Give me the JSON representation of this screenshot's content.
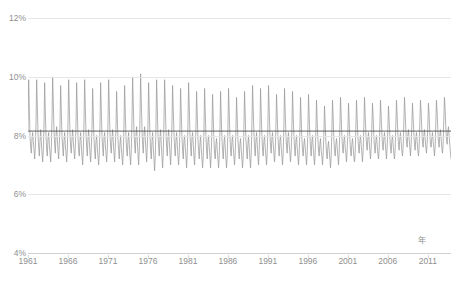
{
  "chart_data": {
    "type": "line",
    "title": "",
    "xlabel": "年",
    "ylabel": "",
    "ylim": [
      4,
      12
    ],
    "xlim": [
      1961,
      2013.9
    ],
    "grid": true,
    "legend": false,
    "y_ticks": [
      "4%",
      "6%",
      "8%",
      "10%",
      "12%"
    ],
    "y_tick_values": [
      4,
      6,
      8,
      10,
      12
    ],
    "x_ticks": [
      "1961",
      "1966",
      "1971",
      "1976",
      "1981",
      "1986",
      "1991",
      "1996",
      "2001",
      "2006",
      "2011"
    ],
    "x_tick_values": [
      1961,
      1966,
      1971,
      1976,
      1981,
      1986,
      1991,
      1996,
      2001,
      2006,
      2011
    ],
    "series": [
      {
        "name": "monthly-rate",
        "color": "#9a9a9a",
        "x_start": 1961.0,
        "x_step": 0.08333,
        "values": [
          8.2,
          9.9,
          8.9,
          8.0,
          7.6,
          7.4,
          7.9,
          8.1,
          7.8,
          7.5,
          7.2,
          7.6,
          8.4,
          9.9,
          9.0,
          8.1,
          7.6,
          7.3,
          7.8,
          8.2,
          7.8,
          7.4,
          7.1,
          7.5,
          8.3,
          9.8,
          8.8,
          8.0,
          7.5,
          7.3,
          7.9,
          8.1,
          7.7,
          7.4,
          7.1,
          7.6,
          8.5,
          10.0,
          9.1,
          8.2,
          7.7,
          7.4,
          8.0,
          8.3,
          7.9,
          7.5,
          7.2,
          7.7,
          8.3,
          9.7,
          8.8,
          8.0,
          7.6,
          7.3,
          7.8,
          8.1,
          7.7,
          7.4,
          7.1,
          7.5,
          8.4,
          9.9,
          9.0,
          8.1,
          7.6,
          7.4,
          7.9,
          8.2,
          7.8,
          7.5,
          7.2,
          7.6,
          8.3,
          9.8,
          8.9,
          8.0,
          7.5,
          7.3,
          7.8,
          8.1,
          7.7,
          7.3,
          7.0,
          7.5,
          8.4,
          9.9,
          9.0,
          8.1,
          7.6,
          7.3,
          7.9,
          8.2,
          7.8,
          7.4,
          7.1,
          7.6,
          8.2,
          9.6,
          8.7,
          7.9,
          7.5,
          7.2,
          7.8,
          8.0,
          7.6,
          7.3,
          7.0,
          7.4,
          8.3,
          9.8,
          8.9,
          8.0,
          7.6,
          7.3,
          7.9,
          8.1,
          7.7,
          7.4,
          7.1,
          7.5,
          8.4,
          9.9,
          9.0,
          8.1,
          7.6,
          7.4,
          7.9,
          8.2,
          7.8,
          7.4,
          7.1,
          7.6,
          8.2,
          9.5,
          8.6,
          7.9,
          7.5,
          7.2,
          7.7,
          8.0,
          7.6,
          7.3,
          7.0,
          7.4,
          8.3,
          9.7,
          8.8,
          8.0,
          7.5,
          7.3,
          7.8,
          8.1,
          7.7,
          7.3,
          7.0,
          7.5,
          8.4,
          10.0,
          9.1,
          8.2,
          7.7,
          7.4,
          8.0,
          8.3,
          7.8,
          7.4,
          7.0,
          7.5,
          8.5,
          10.1,
          9.2,
          8.3,
          7.7,
          7.4,
          8.0,
          8.3,
          7.9,
          7.5,
          7.1,
          7.6,
          8.3,
          9.8,
          8.9,
          8.0,
          7.5,
          7.2,
          7.8,
          8.1,
          7.6,
          7.2,
          6.8,
          7.3,
          8.2,
          9.9,
          9.0,
          8.1,
          7.6,
          7.3,
          7.9,
          8.2,
          7.7,
          7.3,
          6.9,
          7.4,
          8.4,
          9.9,
          9.1,
          8.2,
          7.6,
          7.3,
          7.9,
          8.2,
          7.8,
          7.4,
          7.0,
          7.5,
          8.3,
          9.7,
          8.9,
          8.1,
          7.6,
          7.3,
          7.8,
          8.1,
          7.7,
          7.3,
          7.0,
          7.4,
          8.2,
          9.6,
          8.8,
          8.0,
          7.5,
          7.2,
          7.8,
          8.0,
          7.6,
          7.3,
          6.9,
          7.4,
          8.3,
          9.8,
          9.0,
          8.1,
          7.6,
          7.3,
          7.9,
          8.1,
          7.7,
          7.3,
          7.0,
          7.5,
          8.2,
          9.5,
          8.7,
          7.9,
          7.5,
          7.2,
          7.7,
          8.0,
          7.6,
          7.2,
          6.9,
          7.3,
          8.1,
          9.6,
          8.8,
          8.0,
          7.5,
          7.2,
          7.8,
          8.0,
          7.6,
          7.3,
          6.9,
          7.4,
          8.2,
          9.4,
          8.6,
          7.9,
          7.4,
          7.2,
          7.7,
          7.9,
          7.5,
          7.2,
          6.9,
          7.3,
          8.1,
          9.5,
          8.7,
          7.9,
          7.5,
          7.2,
          7.7,
          8.0,
          7.6,
          7.2,
          6.9,
          7.3,
          8.2,
          9.6,
          8.8,
          8.0,
          7.5,
          7.3,
          7.8,
          8.0,
          7.6,
          7.3,
          7.0,
          7.4,
          8.1,
          9.3,
          8.6,
          7.9,
          7.5,
          7.2,
          7.7,
          7.9,
          7.5,
          7.2,
          6.9,
          7.3,
          8.2,
          9.5,
          8.7,
          7.9,
          7.5,
          7.2,
          7.7,
          8.0,
          7.6,
          7.2,
          6.9,
          7.4,
          8.3,
          9.7,
          8.9,
          8.1,
          7.6,
          7.3,
          7.8,
          8.1,
          7.7,
          7.3,
          7.0,
          7.5,
          8.2,
          9.6,
          8.8,
          8.0,
          7.5,
          7.3,
          7.8,
          8.0,
          7.6,
          7.3,
          7.0,
          7.4,
          8.3,
          9.7,
          8.9,
          8.1,
          7.6,
          7.4,
          7.9,
          8.1,
          7.7,
          7.4,
          7.1,
          7.5,
          8.2,
          9.4,
          8.7,
          8.0,
          7.6,
          7.3,
          7.8,
          8.0,
          7.6,
          7.3,
          7.0,
          7.4,
          8.3,
          9.6,
          8.8,
          8.1,
          7.6,
          7.4,
          7.9,
          8.1,
          7.7,
          7.4,
          7.1,
          7.5,
          8.2,
          9.5,
          8.7,
          8.0,
          7.6,
          7.3,
          7.8,
          8.0,
          7.6,
          7.3,
          7.0,
          7.4,
          8.1,
          9.3,
          8.6,
          7.9,
          7.5,
          7.3,
          7.7,
          7.9,
          7.6,
          7.3,
          7.0,
          7.4,
          8.2,
          9.4,
          8.7,
          8.0,
          7.6,
          7.3,
          7.8,
          8.0,
          7.6,
          7.3,
          7.0,
          7.4,
          8.1,
          9.2,
          8.5,
          7.9,
          7.5,
          7.3,
          7.7,
          7.9,
          7.5,
          7.3,
          7.0,
          7.4,
          8.0,
          9.0,
          8.4,
          7.8,
          7.4,
          7.2,
          7.6,
          7.8,
          7.5,
          7.2,
          6.9,
          7.3,
          8.1,
          9.2,
          8.6,
          7.9,
          7.5,
          7.3,
          7.7,
          7.9,
          7.6,
          7.3,
          7.0,
          7.4,
          8.2,
          9.3,
          8.7,
          8.0,
          7.6,
          7.4,
          7.8,
          8.0,
          7.6,
          7.4,
          7.1,
          7.5,
          8.1,
          9.1,
          8.5,
          7.9,
          7.5,
          7.3,
          7.7,
          7.9,
          7.6,
          7.3,
          7.1,
          7.4,
          8.2,
          9.2,
          8.6,
          8.0,
          7.6,
          7.4,
          7.8,
          8.0,
          7.7,
          7.4,
          7.1,
          7.5,
          8.3,
          9.3,
          8.7,
          8.1,
          7.7,
          7.5,
          7.9,
          8.1,
          7.8,
          7.5,
          7.2,
          7.6,
          8.2,
          9.1,
          8.6,
          8.0,
          7.6,
          7.4,
          7.8,
          8.0,
          7.7,
          7.4,
          7.2,
          7.5,
          8.3,
          9.2,
          8.7,
          8.1,
          7.7,
          7.5,
          7.9,
          8.1,
          7.8,
          7.5,
          7.2,
          7.6,
          8.2,
          9.0,
          8.5,
          8.0,
          7.6,
          7.4,
          7.8,
          8.0,
          7.7,
          7.4,
          7.2,
          7.5,
          8.3,
          9.2,
          8.7,
          8.1,
          7.7,
          7.5,
          7.9,
          8.1,
          7.8,
          7.5,
          7.3,
          7.6,
          8.4,
          9.3,
          8.8,
          8.2,
          7.8,
          7.6,
          8.0,
          8.2,
          7.9,
          7.6,
          7.3,
          7.7,
          8.3,
          9.1,
          8.6,
          8.1,
          7.7,
          7.5,
          7.9,
          8.1,
          7.8,
          7.5,
          7.3,
          7.6,
          8.4,
          9.2,
          8.8,
          8.2,
          7.8,
          7.6,
          8.0,
          8.2,
          7.9,
          7.6,
          7.4,
          7.7,
          8.3,
          9.1,
          8.7,
          8.1,
          7.7,
          7.6,
          7.9,
          8.1,
          7.8,
          7.6,
          7.3,
          7.6,
          8.4,
          9.2,
          8.8,
          8.2,
          7.8,
          7.6,
          8.0,
          8.2,
          7.9,
          7.6,
          7.4,
          7.7,
          8.5,
          9.3,
          8.9,
          8.3,
          7.9,
          7.7,
          8.1,
          8.3,
          8.0,
          7.7,
          7.4,
          7.2
        ]
      }
    ],
    "reference_line": {
      "name": "trend-line",
      "value": 8.15,
      "color": "#4d4d4d"
    }
  },
  "axis": {
    "y_title": "",
    "x_title": "年"
  }
}
